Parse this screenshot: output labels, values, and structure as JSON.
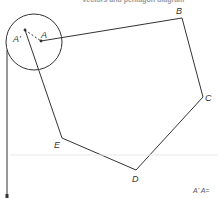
{
  "header": {
    "cropped_caption": "Vectors and pentagon diagram"
  },
  "diagram": {
    "stroke_color": "#333333",
    "vertices": [
      {
        "label": "A",
        "x": 41,
        "y": 41
      },
      {
        "label": "B",
        "x": 182,
        "y": 18
      },
      {
        "label": "C",
        "x": 203,
        "y": 97
      },
      {
        "label": "D",
        "x": 136,
        "y": 170
      },
      {
        "label": "E",
        "x": 62,
        "y": 138
      }
    ],
    "point_a_prime": {
      "label": "A'",
      "x": 25,
      "y": 30
    },
    "circle": {
      "cx": 34,
      "cy": 42,
      "r": 28
    },
    "labels": {
      "A": "A",
      "A_prime": "A'",
      "B": "B",
      "C": "C",
      "D": "D",
      "E": "E"
    }
  },
  "footer": {
    "cropped_equation": "A' A="
  }
}
